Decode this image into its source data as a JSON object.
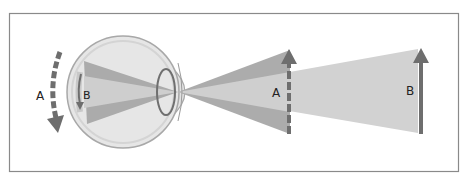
{
  "diagram": {
    "colors": {
      "background": "#ffffff",
      "frame": "#8a8a8a",
      "eyeball_fill": "#e6e6e6",
      "eyeball_edge": "#a8a8a8",
      "beam_outer": "#a9a9a9",
      "beam_inner": "#cfcfcf",
      "arrow": "#6e6e6e",
      "label_text": "#222222"
    },
    "labels": {
      "outer_arc_label": "A",
      "retina_arc_label": "B",
      "near_object_label": "A",
      "far_object_label": "B"
    },
    "elements": [
      {
        "id": "eyeball",
        "description": "Eyeball cross-section with lens and cornea"
      },
      {
        "id": "outer-arc-arrow",
        "description": "Dashed curved arrow A outside eye pointing down",
        "style": "dashed"
      },
      {
        "id": "retina-arc-arrow",
        "description": "Solid curved arrow B on retina pointing down",
        "style": "solid"
      },
      {
        "id": "near-object-arrow",
        "description": "Dashed vertical arrow A (near object) pointing up",
        "style": "dashed"
      },
      {
        "id": "far-object-arrow",
        "description": "Solid vertical arrow B (far object) pointing up",
        "style": "solid"
      },
      {
        "id": "beam-near",
        "description": "Wide light cone from near object A through lens"
      },
      {
        "id": "beam-far",
        "description": "Narrow light cone from far object B through lens"
      }
    ]
  }
}
